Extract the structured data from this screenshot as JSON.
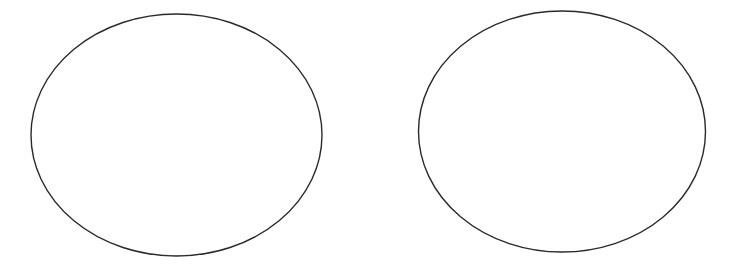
{
  "canvas": {
    "width": 744,
    "height": 269,
    "background": "#ffffff"
  },
  "shapes": [
    {
      "type": "ellipse",
      "cx": 176.5,
      "cy": 135,
      "rx": 145.5,
      "ry": 121,
      "stroke": "#2a2a2a",
      "stroke_width": 1.4,
      "fill": "none"
    },
    {
      "type": "ellipse",
      "cx": 562,
      "cy": 131.5,
      "rx": 143.5,
      "ry": 120.5,
      "stroke": "#2a2a2a",
      "stroke_width": 1.4,
      "fill": "none"
    }
  ]
}
